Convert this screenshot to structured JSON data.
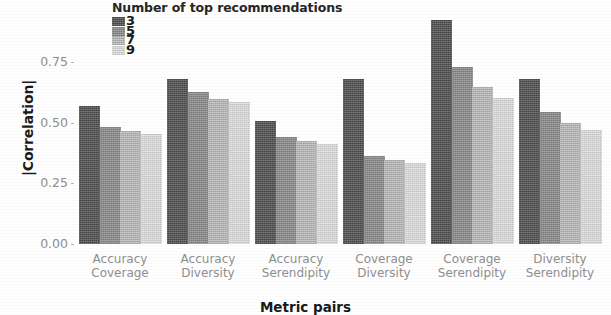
{
  "chart_data": {
    "type": "bar",
    "title": "",
    "xlabel": "Metric pairs",
    "ylabel": "|Correlation|",
    "ylim": [
      0.0,
      0.95
    ],
    "yticks": [
      "0.00",
      "0.25",
      "0.50",
      "0.75"
    ],
    "ytick_values": [
      0.0,
      0.25,
      0.5,
      0.75
    ],
    "grid": false,
    "legend_position": "top-center",
    "legend_title": "Number of top recommendations",
    "categories": [
      "Accuracy\nCoverage",
      "Accuracy\nDiversity",
      "Accuracy\nSerendipity",
      "Coverage\nDiversity",
      "Coverage\nSerendipity",
      "Diversity\nSerendipity"
    ],
    "category_lines": [
      [
        "Accuracy",
        "Coverage"
      ],
      [
        "Accuracy",
        "Diversity"
      ],
      [
        "Accuracy",
        "Serendipity"
      ],
      [
        "Coverage",
        "Diversity"
      ],
      [
        "Coverage",
        "Serendipity"
      ],
      [
        "Diversity",
        "Serendipity"
      ]
    ],
    "series": [
      {
        "name": "3",
        "color": "#4d4d4d",
        "values": [
          0.568,
          0.68,
          0.508,
          0.68,
          0.925,
          0.68
        ]
      },
      {
        "name": "5",
        "color": "#8a8a8a",
        "values": [
          0.482,
          0.628,
          0.44,
          0.362,
          0.73,
          0.545
        ]
      },
      {
        "name": "7",
        "color": "#b9b9b9",
        "values": [
          0.465,
          0.6,
          0.425,
          0.345,
          0.65,
          0.5
        ]
      },
      {
        "name": "9",
        "color": "#dedede",
        "values": [
          0.455,
          0.585,
          0.412,
          0.333,
          0.605,
          0.472
        ]
      }
    ]
  },
  "legend": {
    "title": "Number of top recommendations",
    "labels": [
      "3",
      "5",
      "7",
      "9"
    ]
  },
  "axes": {
    "y_title": "|Correlation|",
    "x_title": "Metric pairs",
    "y_ticks": [
      "0.75",
      "0.50",
      "0.25",
      "0.00"
    ]
  },
  "colors": {
    "series_3": "#4d4d4d",
    "series_5": "#8a8a8a",
    "series_7": "#b9b9b9",
    "series_9": "#dedede",
    "background": "#ffffff",
    "tick_text": "#8f8f8f",
    "axis_title": "#1a1a1a"
  }
}
